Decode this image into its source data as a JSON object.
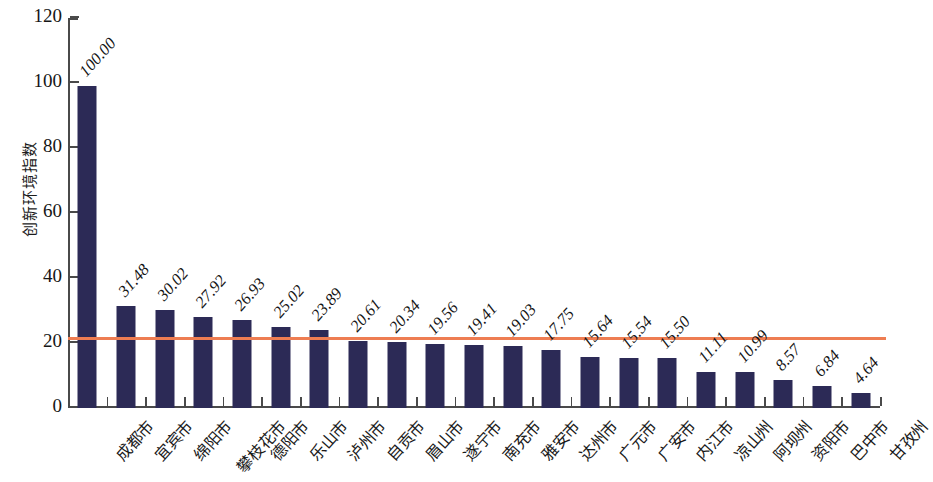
{
  "chart_data": {
    "type": "bar",
    "title": "",
    "xlabel": "",
    "ylabel": "创新环境指数",
    "ylim": [
      0,
      120
    ],
    "yticks": [
      0,
      20,
      40,
      60,
      80,
      100,
      120
    ],
    "ytick_labels": [
      "0",
      "20",
      "40",
      "60",
      "80",
      "100",
      "120"
    ],
    "grid": false,
    "legend": null,
    "bar_color": "#2c2a56",
    "reference_line": {
      "value": 21.0,
      "color": "#ee7d52",
      "label": ""
    },
    "categories": [
      "成都市",
      "宜宾市",
      "绵阳市",
      "攀枝花市",
      "德阳市",
      "乐山市",
      "泸州市",
      "自贡市",
      "眉山市",
      "遂宁市",
      "南充市",
      "雅安市",
      "达州市",
      "广元市",
      "广安市",
      "内江市",
      "凉山州",
      "阿坝州",
      "资阳市",
      "巴中市",
      "甘孜州"
    ],
    "values": [
      100.0,
      31.48,
      30.02,
      27.92,
      26.93,
      25.02,
      23.89,
      20.61,
      20.34,
      19.56,
      19.41,
      19.03,
      17.75,
      15.64,
      15.54,
      15.5,
      11.11,
      10.99,
      8.57,
      6.84,
      4.64
    ],
    "bar_heights": [
      99.0,
      31.48,
      30.02,
      27.92,
      26.93,
      25.02,
      23.89,
      20.61,
      20.34,
      19.56,
      19.41,
      19.03,
      17.75,
      15.64,
      15.54,
      15.5,
      11.11,
      10.99,
      8.57,
      6.84,
      4.64
    ],
    "value_labels": [
      "100.00",
      "31.48",
      "30.02",
      "27.92",
      "26.93",
      "25.02",
      "23.89",
      "20.61",
      "20.34",
      "19.56",
      "19.41",
      "19.03",
      "17.75",
      "15.64",
      "15.54",
      "15.50",
      "11.11",
      "10.99",
      "8.57",
      "6.84",
      "4.64"
    ]
  }
}
